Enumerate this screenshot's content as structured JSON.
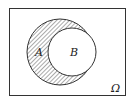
{
  "diagram": {
    "type": "venn",
    "universe_label": "Ω",
    "sets": [
      {
        "name": "A",
        "label": "A",
        "shaded": true
      },
      {
        "name": "B",
        "label": "B",
        "shaded": false,
        "subset_of": "A"
      }
    ],
    "shaded_region": "A minus B"
  }
}
